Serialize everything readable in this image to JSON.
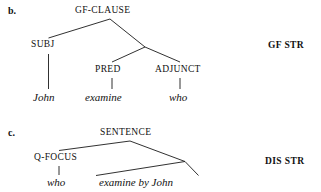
{
  "figure": {
    "background_color": "#ffffff",
    "ink_color": "#1a1a1a"
  },
  "panel_b": {
    "enumerator": "b.",
    "side_label": "GF STR",
    "nodes": {
      "root": "GF-CLAUSE",
      "subj": "SUBJ",
      "pred": "PRED",
      "adjunct": "ADJUNCT"
    },
    "terminals": {
      "subj_word": "John",
      "pred_word": "examine",
      "adjunct_word": "who"
    }
  },
  "panel_c": {
    "enumerator": "c.",
    "side_label": "DIS STR",
    "nodes": {
      "root": "SENTENCE",
      "q_focus": "Q-FOCUS"
    },
    "terminals": {
      "q_focus_word": "who",
      "triangle_string": "examine by John"
    }
  }
}
